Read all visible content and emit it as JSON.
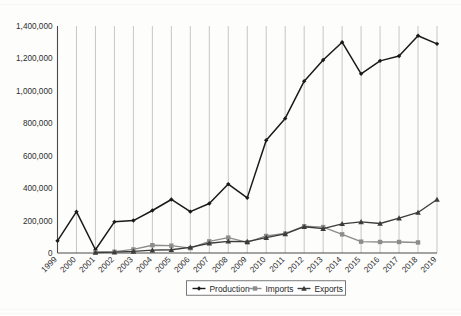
{
  "chart_data": {
    "type": "line",
    "title": "",
    "subtitle": "",
    "xlabel": "",
    "ylabel": "",
    "grid": "vertical",
    "legend_position": "bottom",
    "ylim": [
      0,
      1400000
    ],
    "yticks": [
      0,
      200000,
      400000,
      600000,
      800000,
      1000000,
      1200000,
      1400000
    ],
    "ytick_labels": [
      "0",
      "200,000",
      "400,000",
      "600,000",
      "800,000",
      "1,000,000",
      "1,200,000",
      "1,400,000"
    ],
    "categories": [
      "1999",
      "2000",
      "2001",
      "2002",
      "2003",
      "2004",
      "2005",
      "2006",
      "2007",
      "2008",
      "2009",
      "2010",
      "2011",
      "2012",
      "2013",
      "2014",
      "2015",
      "2016",
      "2017",
      "2018",
      "2019"
    ],
    "series": [
      {
        "name": "Production",
        "marker": "diamond",
        "color": "#1a1a1a",
        "values": [
          75000,
          255000,
          20000,
          192000,
          200000,
          262000,
          330000,
          255000,
          305000,
          425000,
          340000,
          695000,
          830000,
          1060000,
          1190000,
          1300000,
          1105000,
          1185000,
          1215000,
          1340000,
          1290000
        ]
      },
      {
        "name": "Imports",
        "marker": "square",
        "color": "#8c8c8c",
        "values": [
          null,
          null,
          5000,
          8000,
          22000,
          48000,
          45000,
          30000,
          72000,
          95000,
          65000,
          105000,
          120000,
          165000,
          160000,
          115000,
          70000,
          68000,
          68000,
          65000,
          null
        ]
      },
      {
        "name": "Exports",
        "marker": "triangle",
        "color": "#3c3c3c",
        "values": [
          null,
          null,
          3000,
          5000,
          10000,
          18000,
          20000,
          35000,
          60000,
          72000,
          70000,
          95000,
          118000,
          162000,
          150000,
          180000,
          192000,
          182000,
          215000,
          250000,
          330000
        ]
      }
    ]
  },
  "legend": {
    "items": [
      {
        "label": "Production"
      },
      {
        "label": "Imports"
      },
      {
        "label": "Exports"
      }
    ]
  }
}
